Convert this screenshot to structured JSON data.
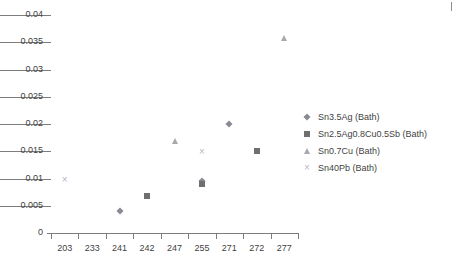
{
  "chart_data": {
    "type": "scatter",
    "title": "",
    "xlabel": "",
    "ylabel": "",
    "categories": [
      "203",
      "233",
      "241",
      "242",
      "247",
      "255",
      "271",
      "272",
      "277"
    ],
    "yticks": [
      "0",
      "0.005",
      "0.01",
      "0.015",
      "0.02",
      "0.025",
      "0.03",
      "0.035",
      "0.04"
    ],
    "ytick_values": [
      0,
      0.005,
      0.01,
      0.015,
      0.02,
      0.025,
      0.03,
      0.035,
      0.04
    ],
    "ylim": [
      0,
      0.04
    ],
    "grid": "horizontal",
    "legend_position": "right",
    "series": [
      {
        "name": "Sn3.5Ag (Bath)",
        "marker": "diamond",
        "color": "#8a8a94",
        "points": [
          {
            "x": "241",
            "y": 0.004
          },
          {
            "x": "255",
            "y": 0.0095
          },
          {
            "x": "271",
            "y": 0.02
          }
        ]
      },
      {
        "name": "Sn2.5Ag0.8Cu0.5Sb (Bath)",
        "marker": "square",
        "color": "#6f6f6f",
        "points": [
          {
            "x": "242",
            "y": 0.0068
          },
          {
            "x": "255",
            "y": 0.009
          },
          {
            "x": "272",
            "y": 0.015
          }
        ]
      },
      {
        "name": "Sn0.7Cu (Bath)",
        "marker": "triangle",
        "color": "#a8a8ae",
        "points": [
          {
            "x": "247",
            "y": 0.0168
          },
          {
            "x": "277",
            "y": 0.0357
          }
        ]
      },
      {
        "name": "Sn40Pb (Bath)",
        "marker": "cross",
        "color": "#b9b9bf",
        "points": [
          {
            "x": "203",
            "y": 0.01
          },
          {
            "x": "255",
            "y": 0.015
          }
        ]
      }
    ]
  },
  "legend": {
    "items": [
      {
        "label": "Sn3.5Ag (Bath)",
        "marker": "diamond"
      },
      {
        "label": "Sn2.5Ag0.8Cu0.5Sb (Bath)",
        "marker": "square"
      },
      {
        "label": "Sn0.7Cu (Bath)",
        "marker": "triangle"
      },
      {
        "label": "Sn40Pb (Bath)",
        "marker": "cross"
      }
    ]
  },
  "colors": {
    "axis": "#7b7b7b",
    "grid": "#7d7d7d",
    "text": "#3f3f3f",
    "background": "#ffffff"
  }
}
